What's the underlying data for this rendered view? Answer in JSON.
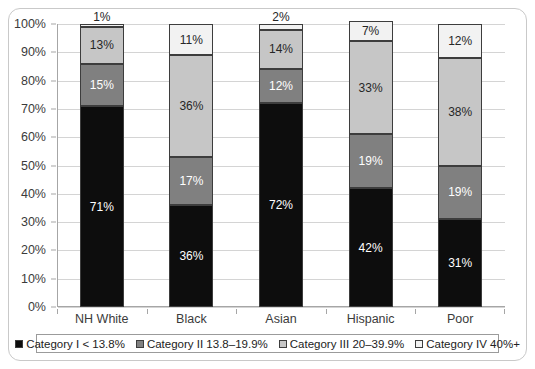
{
  "chart_data": {
    "type": "bar",
    "subtype": "stacked-bar-100-percent",
    "title": "",
    "xlabel": "",
    "ylabel": "",
    "ylim": [
      0,
      100
    ],
    "y_ticks": [
      "0%",
      "10%",
      "20%",
      "30%",
      "40%",
      "50%",
      "60%",
      "70%",
      "80%",
      "90%",
      "100%"
    ],
    "grid": true,
    "legend_position": "bottom",
    "categories": [
      "NH White",
      "Black",
      "Asian",
      "Hispanic",
      "Poor"
    ],
    "series": [
      {
        "name": "Category I < 13.8%",
        "color": "#0d0d0d",
        "values": [
          71,
          36,
          72,
          42,
          31
        ],
        "labels": [
          "71%",
          "36%",
          "72%",
          "42%",
          "31%"
        ]
      },
      {
        "name": "Category II 13.8–19.9%",
        "color": "#808080",
        "values": [
          15,
          17,
          12,
          19,
          19
        ],
        "labels": [
          "15%",
          "17%",
          "12%",
          "19%",
          "19%"
        ]
      },
      {
        "name": "Category III 20–39.9%",
        "color": "#c6c6c6",
        "values": [
          13,
          36,
          14,
          33,
          38
        ],
        "labels": [
          "13%",
          "36%",
          "14%",
          "33%",
          "38%"
        ]
      },
      {
        "name": "Category IV 40%+",
        "color": "#f2f2f2",
        "values": [
          1,
          11,
          2,
          7,
          12
        ],
        "labels": [
          "1%",
          "11%",
          "2%",
          "7%",
          "12%"
        ]
      }
    ]
  },
  "legend": {
    "items": [
      {
        "label": "Category I < 13.8%",
        "color": "#0d0d0d"
      },
      {
        "label": "Category II 13.8–19.9%",
        "color": "#808080"
      },
      {
        "label": "Category III 20–39.9%",
        "color": "#c6c6c6"
      },
      {
        "label": "Category IV 40%+",
        "color": "#f2f2f2"
      }
    ]
  },
  "colors": {
    "frame_border": "#c9c9c9",
    "axis": "#a6a6a6",
    "gridline": "#d4d4d4",
    "segment_border": "#3d3d3d",
    "background": "#ffffff",
    "text": "#3b3b3b"
  }
}
